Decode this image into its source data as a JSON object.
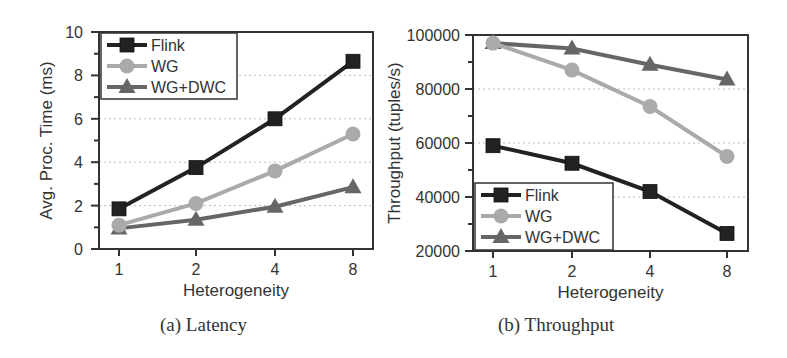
{
  "chart_data": [
    {
      "type": "line",
      "title": "(a) Latency",
      "xlabel": "Heterogeneity",
      "ylabel": "Avg. Proc. Time (ms)",
      "categories": [
        "1",
        "2",
        "4",
        "8"
      ],
      "yticks": [
        "0",
        "2",
        "4",
        "6",
        "8",
        "10"
      ],
      "ylim": [
        0,
        10
      ],
      "grid": "dotted horizontal",
      "legend_position": "upper left",
      "series": [
        {
          "name": "Flink",
          "marker": "square",
          "color": "#222222",
          "values": [
            1.85,
            3.75,
            6.0,
            8.65
          ]
        },
        {
          "name": "WG",
          "marker": "circle",
          "color": "#aaaaaa",
          "values": [
            1.1,
            2.1,
            3.6,
            5.3
          ]
        },
        {
          "name": "WG+DWC",
          "marker": "triangle",
          "color": "#666666",
          "values": [
            0.95,
            1.35,
            1.95,
            2.85
          ]
        }
      ]
    },
    {
      "type": "line",
      "title": "(b) Throughput",
      "xlabel": "Heterogeneity",
      "ylabel": "Throughput (tuples/s)",
      "categories": [
        "1",
        "2",
        "4",
        "8"
      ],
      "yticks": [
        "20000",
        "40000",
        "60000",
        "80000",
        "100000"
      ],
      "ylim": [
        20000,
        100000
      ],
      "grid": "dotted horizontal",
      "legend_position": "lower left",
      "series": [
        {
          "name": "Flink",
          "marker": "square",
          "color": "#222222",
          "values": [
            59000,
            52500,
            42000,
            26500
          ]
        },
        {
          "name": "WG",
          "marker": "circle",
          "color": "#aaaaaa",
          "values": [
            97000,
            87000,
            73500,
            55000
          ]
        },
        {
          "name": "WG+DWC",
          "marker": "triangle",
          "color": "#666666",
          "values": [
            97000,
            95000,
            89000,
            83500
          ]
        }
      ]
    }
  ],
  "captions": {
    "a": "(a) Latency",
    "b": "(b) Throughput"
  }
}
